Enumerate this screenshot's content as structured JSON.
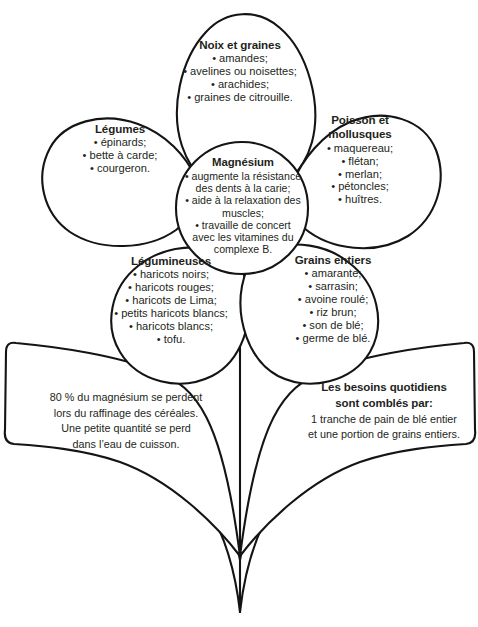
{
  "diagram": {
    "title": "Magnésium",
    "type": "flower-diagram",
    "colors": {
      "outline": "#141414",
      "text": "#231f20",
      "background": "#ffffff"
    }
  },
  "center": {
    "heading": "Magnésium",
    "items": [
      "• augmente la résistance",
      "des dents à la carie;",
      "• aide à la relaxation des",
      "muscles;",
      "• travaille de concert",
      "avec les vitamines du",
      "complexe B."
    ]
  },
  "petals": [
    {
      "id": "noix-et-graines",
      "heading": "Noix et graines",
      "items": [
        "• amandes;",
        "• avelines ou noisettes;",
        "• arachides;",
        "• graines de citrouille."
      ]
    },
    {
      "id": "legumes",
      "heading": "Légumes",
      "items": [
        "• épinards;",
        "• bette à carde;",
        "• courgeron."
      ]
    },
    {
      "id": "poisson-et-mollusques",
      "heading_line1": "Poisson et",
      "heading_line2": "mollusques",
      "items": [
        "• maquereau;",
        "• flétan;",
        "• merlan;",
        "• pétoncles;",
        "• huîtres."
      ]
    },
    {
      "id": "legumineuses",
      "heading": "Légumineuses",
      "items": [
        "• haricots noirs;",
        "• haricots rouges;",
        "• haricots de Lima;",
        "• petits haricots blancs;",
        "• haricots blancs;",
        "• tofu."
      ]
    },
    {
      "id": "grains-entiers",
      "heading": "Grains entiers",
      "items": [
        "• amarante;",
        "• sarrasin;",
        "• avoine roulé;",
        "• riz brun;",
        "• son de blé;",
        "• germe de blé."
      ]
    }
  ],
  "leaves": [
    {
      "id": "leaf-left",
      "lines": [
        "80 % du magnésium se perdent",
        "lors du raffinage des céréales.",
        "Une petite quantité se perd",
        "dans l’eau de cuisson."
      ]
    },
    {
      "id": "leaf-right",
      "heading_line1": "Les besoins quotidiens",
      "heading_line2": "sont comblés par:",
      "lines": [
        "1 tranche de pain de blé entier",
        "et une portion de grains entiers."
      ]
    }
  ]
}
